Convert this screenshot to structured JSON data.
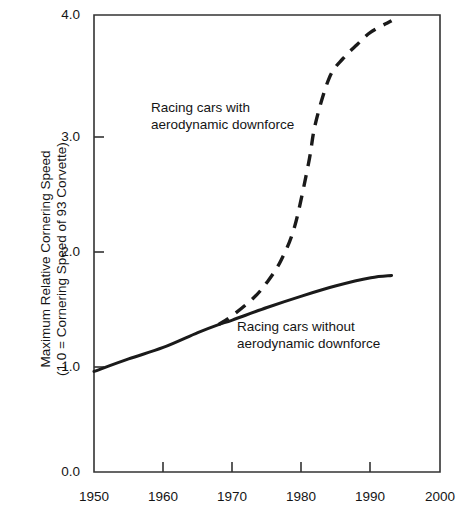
{
  "chart_data": {
    "type": "line",
    "title": "",
    "subtitle": "",
    "xlabel": "",
    "ylabel": "Maximum Relative Cornering Speed",
    "ylabel_line2": "(1.0 = Cornering Speed of 93 Corvette)",
    "xlim": [
      1950,
      2000
    ],
    "ylim": [
      0.0,
      4.0
    ],
    "grid": false,
    "legend": "none (inline annotations)",
    "xticks": [
      1950,
      1960,
      1970,
      1980,
      1990,
      2000
    ],
    "xtick_labels": [
      "1950",
      "1960",
      "1970",
      "1980",
      "1990",
      "2000"
    ],
    "yticks": [
      0.0,
      1.0,
      2.0,
      3.0,
      4.0
    ],
    "ytick_labels": [
      "0.0",
      "1.0",
      "2.0",
      "3.0",
      "4.0"
    ],
    "annotations": [
      {
        "id": "with-downforce",
        "line1": "Racing cars with",
        "line2": "aerodynamic downforce"
      },
      {
        "id": "without-downforce",
        "line1": "Racing cars without",
        "line2": "aerodynamic downforce"
      }
    ],
    "series": [
      {
        "name": "Racing cars without aerodynamic downforce",
        "style": "solid",
        "color": "#1a1a1a",
        "x": [
          1950,
          1955,
          1960,
          1965,
          1968,
          1970,
          1975,
          1980,
          1985,
          1990,
          1993
        ],
        "values": [
          0.88,
          0.99,
          1.09,
          1.22,
          1.29,
          1.33,
          1.44,
          1.54,
          1.63,
          1.7,
          1.72
        ]
      },
      {
        "name": "Racing cars with aerodynamic downforce",
        "style": "dashed",
        "color": "#1a1a1a",
        "x": [
          1968,
          1970,
          1973,
          1975,
          1977,
          1979,
          1981,
          1982,
          1984,
          1986,
          1988,
          1990,
          1993
        ],
        "values": [
          1.29,
          1.37,
          1.52,
          1.66,
          1.85,
          2.15,
          2.7,
          3.05,
          3.45,
          3.62,
          3.74,
          3.85,
          3.95
        ]
      }
    ]
  },
  "axis": {
    "x_start_px": 94,
    "x_end_px": 440,
    "y_zero_px": 472,
    "y_top_px": 15
  }
}
